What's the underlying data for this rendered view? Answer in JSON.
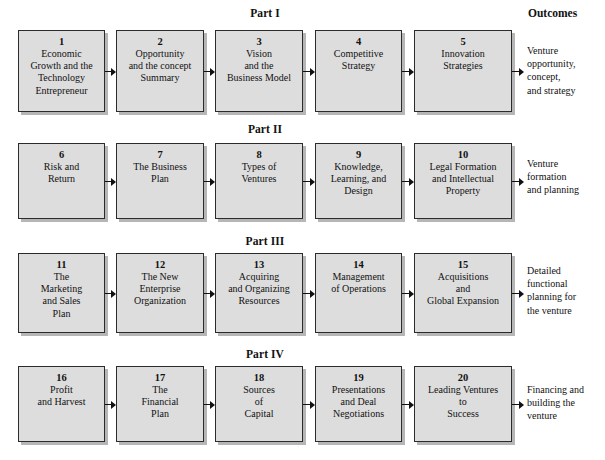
{
  "diagram": {
    "outcomes_header": "Outcomes",
    "parts": [
      {
        "title": "Part I",
        "outcome": "Venture\nopportunity,\nconcept,\nand strategy",
        "chapters": [
          {
            "number": "1",
            "title": "Economic\nGrowth and the\nTechnology\nEntrepreneur"
          },
          {
            "number": "2",
            "title": "Opportunity\nand the concept\nSummary"
          },
          {
            "number": "3",
            "title": "Vision\nand the\nBusiness Model"
          },
          {
            "number": "4",
            "title": "Competitive\nStrategy"
          },
          {
            "number": "5",
            "title": "Innovation\nStrategies"
          }
        ]
      },
      {
        "title": "Part II",
        "outcome": "Venture\nformation\nand planning",
        "chapters": [
          {
            "number": "6",
            "title": "Risk and\nReturn"
          },
          {
            "number": "7",
            "title": "The Business\nPlan"
          },
          {
            "number": "8",
            "title": "Types of\nVentures"
          },
          {
            "number": "9",
            "title": "Knowledge,\nLearning, and\nDesign"
          },
          {
            "number": "10",
            "title": "Legal Formation\nand Intellectual\nProperty"
          }
        ]
      },
      {
        "title": "Part III",
        "outcome": "Detailed\nfunctional\nplanning for\nthe venture",
        "chapters": [
          {
            "number": "11",
            "title": "The\nMarketing\nand Sales\nPlan"
          },
          {
            "number": "12",
            "title": "The New\nEnterprise\nOrganization"
          },
          {
            "number": "13",
            "title": "Acquiring\nand Organizing\nResources"
          },
          {
            "number": "14",
            "title": "Management\nof Operations"
          },
          {
            "number": "15",
            "title": "Acquisitions\nand\nGlobal Expansion"
          }
        ]
      },
      {
        "title": "Part IV",
        "outcome": "Financing and\nbuilding the\nventure",
        "chapters": [
          {
            "number": "16",
            "title": "Profit\nand Harvest"
          },
          {
            "number": "17",
            "title": "The\nFinancial\nPlan"
          },
          {
            "number": "18",
            "title": "Sources\nof\nCapital"
          },
          {
            "number": "19",
            "title": "Presentations\nand Deal\nNegotiations"
          },
          {
            "number": "20",
            "title": "Leading Ventures\nto\nSuccess"
          }
        ]
      }
    ]
  },
  "style": {
    "box_fill": "#dddddd",
    "box_border": "#2b2b2b",
    "box_shadow": "#b6b6b6",
    "text_color": "#111111",
    "page_background": "#ffffff"
  }
}
